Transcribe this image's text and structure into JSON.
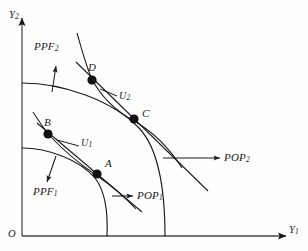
{
  "figure": {
    "kind": "production-possibility-frontier-diagram",
    "background_color": "#fefefe",
    "stroke_color": "#1a1a1a",
    "axes": {
      "origin_label": "O",
      "y_axis_label": "Y",
      "y_axis_sub": "2",
      "x_axis_label": "Y",
      "x_axis_sub": "1"
    },
    "labels": {
      "ppf1": "PPF",
      "ppf1_sub": "1",
      "ppf2": "PPF",
      "ppf2_sub": "2",
      "u1": "U",
      "u1_sub": "1",
      "u2": "U",
      "u2_sub": "2",
      "pop1": "POP",
      "pop1_sub": "1",
      "pop2": "POP",
      "pop2_sub": "2",
      "point_a": "A",
      "point_b": "B",
      "point_c": "C",
      "point_d": "D"
    },
    "points": [
      {
        "name": "A",
        "x": 97,
        "y": 174
      },
      {
        "name": "B",
        "x": 48,
        "y": 134
      },
      {
        "name": "C",
        "x": 134,
        "y": 119
      },
      {
        "name": "D",
        "x": 92,
        "y": 80
      }
    ],
    "curves": [
      {
        "name": "PPF1",
        "role": "inner production possibility frontier"
      },
      {
        "name": "PPF2",
        "role": "outer production possibility frontier"
      },
      {
        "name": "U1",
        "role": "lower indifference curve through B and A"
      },
      {
        "name": "U2",
        "role": "upper indifference curve through D and C"
      },
      {
        "name": "POP1",
        "role": "inner price line tangent at A"
      },
      {
        "name": "POP2",
        "role": "outer price line tangent at C"
      }
    ]
  }
}
